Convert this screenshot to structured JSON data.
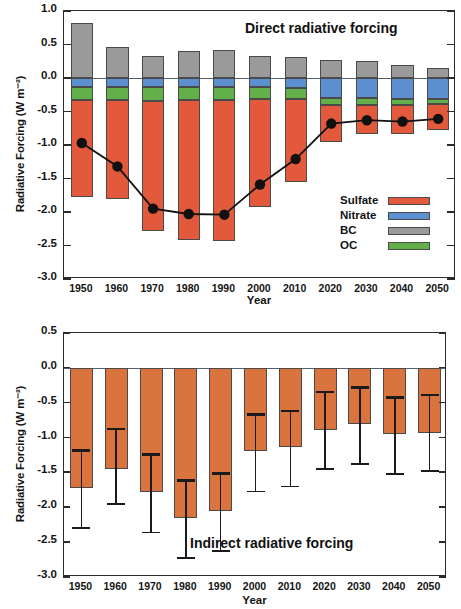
{
  "figure": {
    "panels": [
      "direct",
      "indirect"
    ]
  },
  "chart_data": [
    {
      "type": "bar",
      "id": "direct",
      "title": "Direct radiative forcing",
      "xlabel": "Year",
      "ylabel": "Radiative Forcing (W m⁻²)",
      "categories": [
        "1950",
        "1960",
        "1970",
        "1980",
        "1990",
        "2000",
        "2010",
        "2020",
        "2030",
        "2040",
        "2050"
      ],
      "ylim": [
        -3.0,
        1.0
      ],
      "yticks": [
        "1.0",
        "0.5",
        "0.0",
        "-0.5",
        "-1.0",
        "-1.5",
        "-2.0",
        "-2.5",
        "-3.0"
      ],
      "ytick_values": [
        1.0,
        0.5,
        0.0,
        -0.5,
        -1.0,
        -1.5,
        -2.0,
        -2.5,
        -3.0
      ],
      "grid": false,
      "stacked": true,
      "legend_position": "inside-bottom-right",
      "series": [
        {
          "name": "Sulfate",
          "color": "#e2593c",
          "values": [
            -1.45,
            -1.48,
            -1.94,
            -2.09,
            -2.11,
            -1.61,
            -1.23,
            -0.55,
            -0.44,
            -0.44,
            -0.39
          ]
        },
        {
          "name": "Nitrate",
          "color": "#5b8fd0",
          "values": [
            -0.13,
            -0.13,
            -0.14,
            -0.14,
            -0.14,
            -0.14,
            -0.15,
            -0.3,
            -0.3,
            -0.31,
            -0.32
          ]
        },
        {
          "name": "BC",
          "color": "#9a9a9a",
          "values": [
            0.82,
            0.47,
            0.33,
            0.41,
            0.42,
            0.33,
            0.31,
            0.27,
            0.25,
            0.19,
            0.15
          ]
        },
        {
          "name": "OC",
          "color": "#63b04a",
          "values": [
            -0.2,
            -0.2,
            -0.2,
            -0.19,
            -0.19,
            -0.17,
            -0.17,
            -0.11,
            -0.1,
            -0.09,
            -0.07
          ]
        }
      ],
      "overlay_line": {
        "name": "Net direct forcing",
        "color": "#111111",
        "marker": "filled-circle",
        "values": [
          -0.97,
          -1.32,
          -1.95,
          -2.03,
          -2.04,
          -1.59,
          -1.21,
          -0.68,
          -0.63,
          -0.65,
          -0.61
        ]
      }
    },
    {
      "type": "bar",
      "id": "indirect",
      "title": "Indirect radiative forcing",
      "xlabel": "Year",
      "ylabel": "Radiative Forcing (W m⁻²)",
      "categories": [
        "1950",
        "1960",
        "1970",
        "1980",
        "1990",
        "2000",
        "2010",
        "2020",
        "2030",
        "2040",
        "2050"
      ],
      "ylim": [
        -3.0,
        0.5
      ],
      "yticks": [
        "0.5",
        "0.0",
        "-0.5",
        "-1.0",
        "-1.5",
        "-2.0",
        "-2.5",
        "-3.0"
      ],
      "ytick_values": [
        0.5,
        0.0,
        -0.5,
        -1.0,
        -1.5,
        -2.0,
        -2.5,
        -3.0
      ],
      "grid": false,
      "color": "#d9743f",
      "values": [
        -1.72,
        -1.45,
        -1.78,
        -2.15,
        -2.05,
        -1.19,
        -1.14,
        -0.89,
        -0.81,
        -0.95,
        -0.93
      ],
      "error_bars": {
        "upper": [
          -1.17,
          -0.86,
          -1.22,
          -1.6,
          -1.5,
          -0.65,
          -0.6,
          -0.33,
          -0.26,
          -0.41,
          -0.37
        ],
        "lower": [
          -2.28,
          -1.94,
          -2.35,
          -2.71,
          -2.61,
          -1.76,
          -1.69,
          -1.44,
          -1.37,
          -1.51,
          -1.47
        ]
      }
    }
  ]
}
